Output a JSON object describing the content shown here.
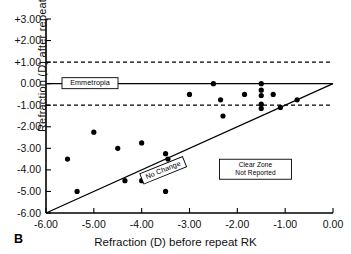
{
  "panel": {
    "letter": "B"
  },
  "axes": {
    "xlabel": "Refraction (D) before repeat RK",
    "ylabel": "Refraction (D) after repeat RK",
    "xticks": [
      "-6.00",
      "-5.00",
      "-4.00",
      "-3.00",
      "-2.00",
      "-1.00",
      "0.00"
    ],
    "yticks": [
      "+3.00",
      "+2.00",
      "+1.00",
      "0.00",
      "-1.00",
      "-2.00",
      "-3.00",
      "-4.00",
      "-5.00",
      "-6.00"
    ]
  },
  "annotations": {
    "emmetropia": "Emmetropia",
    "no_change": "No Change",
    "clear_zone_line1": "Clear  Zone",
    "clear_zone_line2": "Not  Reported"
  },
  "colors": {
    "axis": "#000000",
    "point": "#000000",
    "background": "#ffffff",
    "dashed": "#000000"
  },
  "chart_data": {
    "type": "scatter",
    "title": "",
    "xlabel": "Refraction (D) before repeat RK",
    "ylabel": "Refraction (D) after repeat RK",
    "xlim": [
      -6.0,
      0.0
    ],
    "ylim": [
      -6.0,
      3.0
    ],
    "grid": false,
    "legend": null,
    "reference_lines": [
      {
        "name": "emmetropia",
        "type": "horizontal",
        "y": 0.0,
        "style": "solid",
        "label": "Emmetropia"
      },
      {
        "name": "plus-one-diopter",
        "type": "horizontal",
        "y": 1.0,
        "style": "dashed"
      },
      {
        "name": "minus-one-diopter",
        "type": "horizontal",
        "y": -1.0,
        "style": "dashed"
      },
      {
        "name": "no-change",
        "type": "identity",
        "from": [
          -6.0,
          -6.0
        ],
        "to": [
          0.0,
          0.0
        ],
        "style": "solid",
        "label": "No Change"
      }
    ],
    "points": [
      {
        "x": -5.55,
        "y": -3.5
      },
      {
        "x": -5.35,
        "y": -5.0
      },
      {
        "x": -5.0,
        "y": -2.25
      },
      {
        "x": -4.35,
        "y": -4.5
      },
      {
        "x": -4.5,
        "y": -3.0
      },
      {
        "x": -4.0,
        "y": -2.75
      },
      {
        "x": -4.0,
        "y": -4.5
      },
      {
        "x": -3.5,
        "y": -5.0
      },
      {
        "x": -3.45,
        "y": -3.5
      },
      {
        "x": -3.5,
        "y": -3.25
      },
      {
        "x": -3.0,
        "y": -0.5
      },
      {
        "x": -2.5,
        "y": 0.0
      },
      {
        "x": -2.35,
        "y": -0.75
      },
      {
        "x": -2.3,
        "y": -1.5
      },
      {
        "x": -1.85,
        "y": -0.5
      },
      {
        "x": -1.5,
        "y": 0.0
      },
      {
        "x": -1.5,
        "y": -0.3
      },
      {
        "x": -1.5,
        "y": -0.55
      },
      {
        "x": -1.5,
        "y": -0.95
      },
      {
        "x": -1.5,
        "y": -1.15
      },
      {
        "x": -1.25,
        "y": -0.5
      },
      {
        "x": -1.1,
        "y": -1.1
      },
      {
        "x": -0.75,
        "y": -0.75
      }
    ]
  }
}
